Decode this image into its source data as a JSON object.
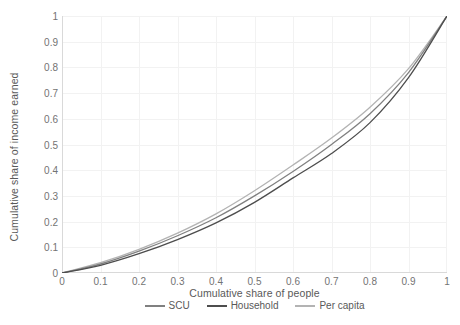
{
  "chart_data": {
    "type": "line",
    "title": "",
    "xlabel": "Cumulative share of people",
    "ylabel": "Cumulative share of income earned",
    "xlim": [
      0,
      1
    ],
    "ylim": [
      0,
      1
    ],
    "grid": true,
    "legend_position": "bottom",
    "xticks": [
      "0",
      "0.1",
      "0.2",
      "0.3",
      "0.4",
      "0.5",
      "0.6",
      "0.7",
      "0.8",
      "0.9",
      "1"
    ],
    "yticks": [
      "0",
      "0.1",
      "0.2",
      "0.3",
      "0.4",
      "0.5",
      "0.6",
      "0.7",
      "0.8",
      "0.9",
      "1"
    ],
    "x": [
      0,
      0.1,
      0.2,
      0.3,
      0.4,
      0.5,
      0.6,
      0.7,
      0.8,
      0.9,
      1
    ],
    "series": [
      {
        "name": "SCU",
        "color": "#808080",
        "values": [
          0,
          0.035,
          0.085,
          0.145,
          0.215,
          0.3,
          0.395,
          0.5,
          0.62,
          0.78,
          1
        ]
      },
      {
        "name": "Household",
        "color": "#4d4d4d",
        "values": [
          0,
          0.03,
          0.075,
          0.13,
          0.195,
          0.275,
          0.37,
          0.465,
          0.585,
          0.76,
          1
        ]
      },
      {
        "name": "Per capita",
        "color": "#b3b3b3",
        "values": [
          0,
          0.04,
          0.092,
          0.155,
          0.23,
          0.32,
          0.42,
          0.525,
          0.645,
          0.795,
          1
        ]
      }
    ]
  },
  "colors": {
    "grid": "#f2f2f2",
    "axis": "#d9d9d9",
    "tick_text": "#737373",
    "title_text": "#595959",
    "background": "#ffffff"
  }
}
